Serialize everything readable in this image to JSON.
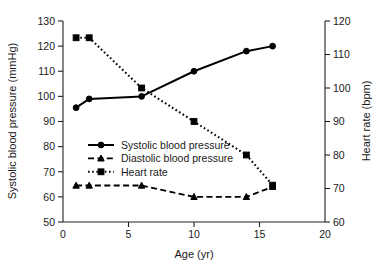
{
  "chart_data": {
    "type": "line",
    "title": "",
    "xlabel": "Age (yr)",
    "ylabel": "Systolic blood pressure (mmHg)",
    "y2label": "Heart rate (bpm)",
    "xlim": [
      0,
      20
    ],
    "ylim": [
      50,
      130
    ],
    "y2lim": [
      60,
      120
    ],
    "xticks": [
      0,
      5,
      10,
      15,
      20
    ],
    "yticks": [
      50,
      60,
      70,
      80,
      90,
      100,
      110,
      120,
      130
    ],
    "y2ticks": [
      60,
      70,
      80,
      90,
      100,
      110,
      120
    ],
    "grid": false,
    "legend_position": "center-left",
    "x": [
      1,
      2,
      6,
      10,
      14,
      16
    ],
    "series": [
      {
        "name": "Systolic blood pressure",
        "axis": "left",
        "units": "mmHg",
        "marker": "circle",
        "linestyle": "solid",
        "color": "#000000",
        "values": [
          95.5,
          99,
          100,
          110,
          118,
          120
        ]
      },
      {
        "name": "Diastolic blood pressure",
        "axis": "left",
        "units": "mmHg",
        "marker": "triangle",
        "linestyle": "dashed",
        "color": "#000000",
        "values": [
          64.5,
          64.5,
          64.5,
          60,
          60,
          64
        ]
      },
      {
        "name": "Heart rate",
        "axis": "right",
        "units": "bpm",
        "marker": "square",
        "linestyle": "dotted",
        "color": "#000000",
        "values": [
          115,
          115,
          100,
          90,
          80,
          71
        ]
      }
    ]
  },
  "axes": {
    "x_title": "Age (yr)",
    "y_left_title": "Systolic blood pressure (mmHg)",
    "y_right_title": "Heart rate (bpm)",
    "x_tick_labels": [
      "0",
      "5",
      "10",
      "15",
      "20"
    ],
    "y_left_tick_labels": [
      "50",
      "60",
      "70",
      "80",
      "90",
      "100",
      "110",
      "120",
      "130"
    ],
    "y_right_tick_labels": [
      "60",
      "70",
      "80",
      "90",
      "100",
      "110",
      "120"
    ]
  },
  "legend": {
    "items": [
      {
        "label": "Systolic blood pressure",
        "marker": "circle",
        "linestyle": "solid"
      },
      {
        "label": "Diastolic blood pressure",
        "marker": "triangle",
        "linestyle": "dashed"
      },
      {
        "label": "Heart rate",
        "marker": "square",
        "linestyle": "dotted"
      }
    ]
  },
  "colors": {
    "ink": "#000000",
    "axis": "#222222",
    "background": "#ffffff"
  }
}
